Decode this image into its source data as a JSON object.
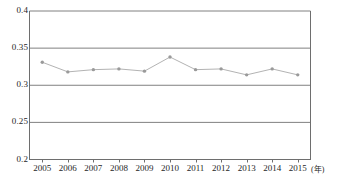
{
  "chart_data": {
    "type": "line",
    "title": "",
    "xlabel": "(年)",
    "ylabel": "",
    "categories": [
      "2005",
      "2006",
      "2007",
      "2008",
      "2009",
      "2010",
      "2011",
      "2012",
      "2013",
      "2014",
      "2015"
    ],
    "values": [
      0.331,
      0.318,
      0.321,
      0.322,
      0.319,
      0.338,
      0.321,
      0.322,
      0.314,
      0.322,
      0.314
    ],
    "series": [
      {
        "name": "",
        "values": [
          0.331,
          0.318,
          0.321,
          0.322,
          0.319,
          0.338,
          0.321,
          0.322,
          0.314,
          0.322,
          0.314
        ]
      }
    ],
    "ylim": [
      0.2,
      0.4
    ],
    "yticks": [
      "0.4",
      "0.35",
      "0.3",
      "0.25",
      "0.2"
    ],
    "ytick_values": [
      0.4,
      0.35,
      0.3,
      0.25,
      0.2
    ],
    "grid": true,
    "grid_axis": "y",
    "legend": "none",
    "marker": "circle",
    "line_color": "#b3b3b3",
    "marker_color": "#9a9a9a",
    "grid_color": "#808080",
    "axis_color": "#6e6e6e",
    "background_color": "#ffffff"
  },
  "axes": {
    "y": {
      "ticks": [
        {
          "label": "0.4"
        },
        {
          "label": "0.35"
        },
        {
          "label": "0.3"
        },
        {
          "label": "0.25"
        },
        {
          "label": "0.2"
        }
      ]
    },
    "x": {
      "unit_label": "(年)",
      "ticks": [
        {
          "label": "2005"
        },
        {
          "label": "2006"
        },
        {
          "label": "2007"
        },
        {
          "label": "2008"
        },
        {
          "label": "2009"
        },
        {
          "label": "2010"
        },
        {
          "label": "2011"
        },
        {
          "label": "2012"
        },
        {
          "label": "2013"
        },
        {
          "label": "2014"
        },
        {
          "label": "2015"
        }
      ]
    }
  }
}
